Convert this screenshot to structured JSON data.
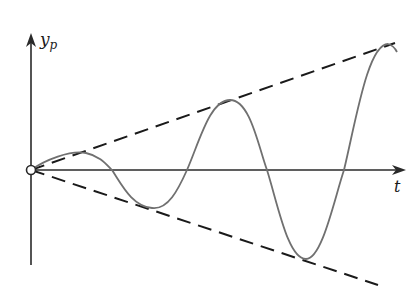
{
  "figure": {
    "y_axis_label": "y",
    "y_axis_label_subscript": "p",
    "x_axis_label": "t",
    "colors": {
      "axes": "#2a2a2a",
      "envelope": "#1a1a1a",
      "curve": "#707070",
      "background": "#ffffff"
    }
  }
}
